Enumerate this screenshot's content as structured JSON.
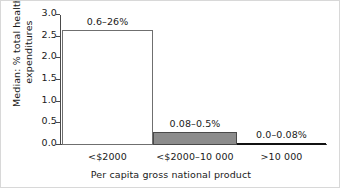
{
  "chart_data": {
    "type": "bar",
    "title": "",
    "xlabel": "Per capita gross national product",
    "ylabel_line1": "Median: % total health",
    "ylabel_line2": "expenditures",
    "categories": [
      "<$2000",
      "<$2000–10 000",
      ">10 000"
    ],
    "values": [
      2.65,
      0.29,
      0.02
    ],
    "point_labels": [
      "0.6–26%",
      "0.08–0.5%",
      "0.0–0.08%"
    ],
    "bar_colors": [
      "#ffffff",
      "#8c8c8c",
      "#111111"
    ],
    "ylim": [
      0.0,
      3.0
    ],
    "yticks": [
      "0.0",
      "0.5",
      "1.0",
      "1.5",
      "2.0",
      "2.5",
      "3.0"
    ],
    "ytick_values": [
      0.0,
      0.5,
      1.0,
      1.5,
      2.0,
      2.5,
      3.0
    ],
    "grid": false,
    "legend": "none"
  }
}
